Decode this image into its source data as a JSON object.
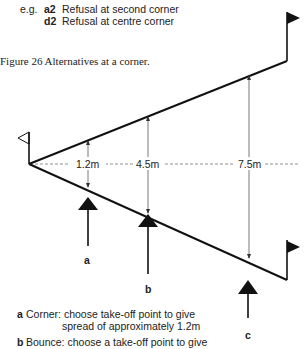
{
  "legend": {
    "prefix": "e.g.",
    "items": [
      {
        "code": "a2",
        "text": "Refusal at second corner"
      },
      {
        "code": "d2",
        "text": "Refusal at centre corner"
      }
    ]
  },
  "figure": {
    "caption": "Figure 26   Alternatives at a corner.",
    "measurements": [
      "1.2m",
      "4.5m",
      "7.5m"
    ],
    "arrow_labels": [
      "a",
      "b",
      "c"
    ]
  },
  "notes": [
    {
      "key": "a",
      "line1": "Corner:  choose take-off point to give",
      "line2": "spread of approximately 1.2m"
    },
    {
      "key": "b",
      "line1": "Bounce:  choose a take-off point to give",
      "line2": ""
    }
  ]
}
